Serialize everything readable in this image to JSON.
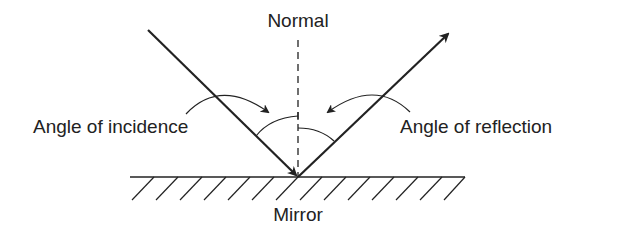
{
  "diagram": {
    "labels": {
      "normal": "Normal",
      "incidence": "Angle of incidence",
      "reflection": "Angle of reflection",
      "mirror": "Mirror"
    },
    "colors": {
      "stroke": "#222222",
      "background": "#ffffff"
    },
    "geometry": {
      "point_of_incidence": [
        298,
        177
      ],
      "incident_ray_start": [
        148,
        30
      ],
      "reflected_ray_end": [
        450,
        32
      ],
      "mirror_x_range": [
        130,
        465
      ],
      "mirror_y": 177,
      "normal_top_y": 40
    }
  }
}
